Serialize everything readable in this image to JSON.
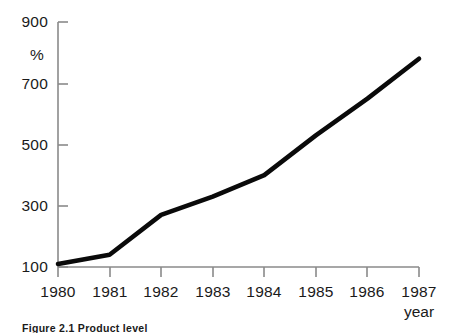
{
  "chart_data": {
    "type": "line",
    "title": "",
    "xlabel": "year",
    "ylabel": "%",
    "x": [
      1980,
      1981,
      1982,
      1983,
      1984,
      1985,
      1986,
      1987
    ],
    "xtick_labels": [
      "1980",
      "1981",
      "1982",
      "1983",
      "1984",
      "1985",
      "1986",
      "1987"
    ],
    "values": [
      110,
      140,
      270,
      330,
      400,
      530,
      650,
      780
    ],
    "ytick_labels": [
      "100",
      "300",
      "500",
      "700",
      "900"
    ],
    "yticks": [
      100,
      300,
      500,
      700,
      900
    ],
    "ylim": [
      100,
      900
    ],
    "xlim": [
      1980,
      1987
    ],
    "grid": false,
    "legend": null,
    "line_color": "#0a0a0a",
    "axis_color": "#8a8a8a",
    "background_color": "#ffffff"
  },
  "caption": {
    "label": "Figure 2.1",
    "text": "Product level"
  }
}
